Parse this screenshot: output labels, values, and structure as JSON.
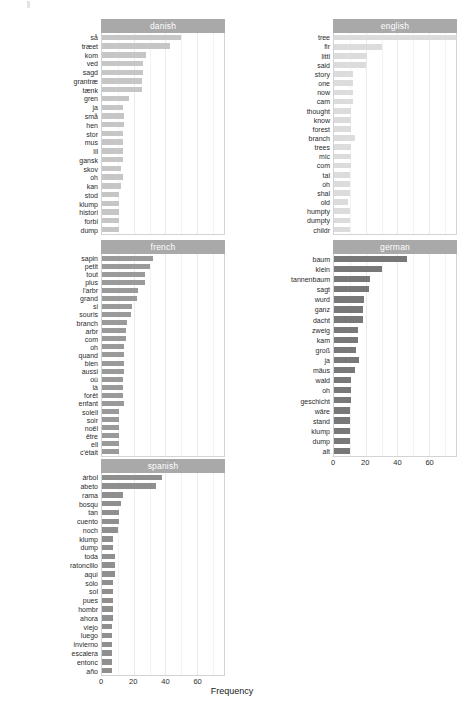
{
  "figure": {
    "xlabel": "Frequency",
    "axis_ticks": [
      "0",
      "20",
      "40",
      "60"
    ],
    "axis_tick_values": [
      0,
      20,
      40,
      60
    ],
    "xlim": [
      0,
      77
    ],
    "strip_color": "#a9a9a9",
    "panel_border_color": "#d3d3d3",
    "grid_color": "#ebebeb"
  },
  "chart_data": {
    "type": "bar",
    "title": "",
    "xlabel": "Frequency",
    "ylabel": "",
    "orientation": "horizontal",
    "xlim": [
      0,
      77
    ],
    "grid": true,
    "legend": "none",
    "facet_layout": "2 columns x 3 rows",
    "panels": [
      {
        "name": "danish",
        "bar_color": "#c6c6c6",
        "categories": [
          "så",
          "træet",
          "kom",
          "ved",
          "sagd",
          "grantræ",
          "tænk",
          "gren",
          "ja",
          "små",
          "hen",
          "stor",
          "mus",
          "lil",
          "gansk",
          "skov",
          "oh",
          "kan",
          "stod",
          "klump",
          "histori",
          "forbi",
          "dump"
        ],
        "values": [
          50,
          43,
          28,
          26,
          26,
          25,
          25,
          17,
          13,
          14,
          14,
          13,
          13,
          13,
          13,
          12,
          13,
          12,
          11,
          11,
          11,
          11,
          11
        ]
      },
      {
        "name": "english",
        "bar_color": "#dcdcdc",
        "categories": [
          "tree",
          "fir",
          "littl",
          "said",
          "story",
          "one",
          "now",
          "cam",
          "thought",
          "know",
          "forest",
          "branch",
          "trees",
          "mic",
          "com",
          "tal",
          "oh",
          "shal",
          "old",
          "humpty",
          "dumpty",
          "childr"
        ],
        "values": [
          77,
          30,
          21,
          20,
          12,
          12,
          12,
          12,
          11,
          11,
          11,
          13,
          11,
          11,
          11,
          10,
          10,
          10,
          9,
          10,
          10,
          10
        ]
      },
      {
        "name": "french",
        "bar_color": "#9a9a9a",
        "categories": [
          "sapin",
          "petit",
          "tout",
          "plus",
          "l'arbr",
          "grand",
          "si",
          "souris",
          "branch",
          "arbr",
          "com",
          "oh",
          "quand",
          "bien",
          "aussi",
          "où",
          "là",
          "forêt",
          "enfant",
          "soleil",
          "soir",
          "noël",
          "être",
          "ell",
          "c'était"
        ],
        "values": [
          32,
          30,
          27,
          27,
          23,
          22,
          19,
          18,
          16,
          15,
          15,
          14,
          14,
          14,
          14,
          13,
          13,
          13,
          14,
          11,
          11,
          11,
          11,
          11,
          11
        ]
      },
      {
        "name": "german",
        "bar_color": "#787878",
        "categories": [
          "baum",
          "klein",
          "tannenbaum",
          "sagt",
          "wurd",
          "ganz",
          "dacht",
          "zweig",
          "kam",
          "groß",
          "ja",
          "mäus",
          "wald",
          "oh",
          "geschicht",
          "wäre",
          "stand",
          "klump",
          "dump",
          "alt"
        ],
        "values": [
          46,
          30,
          23,
          22,
          19,
          18,
          18,
          15,
          15,
          14,
          16,
          13,
          11,
          11,
          11,
          10,
          10,
          10,
          10,
          10
        ]
      },
      {
        "name": "spanish",
        "bar_color": "#8f8f8f",
        "categories": [
          "árbol",
          "abeto",
          "rama",
          "bosqu",
          "tan",
          "cuento",
          "noch",
          "klump",
          "dump",
          "toda",
          "ratoncillo",
          "aquí",
          "sólo",
          "sol",
          "pues",
          "hombr",
          "ahora",
          "viejo",
          "luego",
          "invierno",
          "escalera",
          "entonc",
          "año"
        ],
        "values": [
          38,
          34,
          13,
          12,
          11,
          11,
          10,
          7,
          7,
          8,
          8,
          8,
          7,
          7,
          7,
          7,
          7,
          6,
          6,
          6,
          6,
          6,
          6
        ]
      }
    ]
  }
}
